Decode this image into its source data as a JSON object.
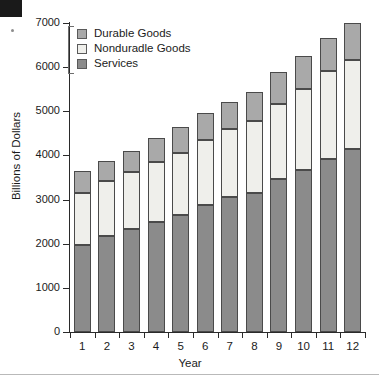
{
  "chart_data": {
    "type": "bar",
    "stacked": true,
    "title": "",
    "xlabel": "Year",
    "ylabel": "Billions of Dollars",
    "categories": [
      "1",
      "2",
      "3",
      "4",
      "5",
      "6",
      "7",
      "8",
      "9",
      "10",
      "11",
      "12"
    ],
    "ylim": [
      0,
      7000
    ],
    "yticks": [
      0,
      1000,
      2000,
      3000,
      4000,
      5000,
      6000,
      7000
    ],
    "ytick_labels": [
      "0",
      "1000",
      "2000",
      "3000",
      "4000",
      "5000",
      "6000",
      "7000"
    ],
    "grid": false,
    "legend_position": "top-left",
    "series": [
      {
        "name": "Services",
        "color": "#8b8b8b",
        "values": [
          1975,
          2180,
          2330,
          2500,
          2650,
          2880,
          3050,
          3150,
          3460,
          3670,
          3930,
          4140
        ]
      },
      {
        "name": "Nonduradle Goods",
        "color": "#efefeb",
        "values": [
          1175,
          1250,
          1300,
          1350,
          1400,
          1470,
          1540,
          1640,
          1700,
          1830,
          1980,
          2020
        ]
      },
      {
        "name": "Durable Goods",
        "color": "#a9a9a9",
        "values": [
          490,
          450,
          470,
          540,
          590,
          620,
          620,
          640,
          720,
          750,
          760,
          840
        ]
      }
    ],
    "totals": [
      3640,
      3880,
      4100,
      4390,
      4640,
      4970,
      5210,
      5430,
      5880,
      6250,
      6670,
      7000
    ]
  },
  "legend": {
    "items": [
      {
        "label": "Durable Goods",
        "color": "#a9a9a9"
      },
      {
        "label": "Nonduradle Goods",
        "color": "#efefeb"
      },
      {
        "label": "Services",
        "color": "#8b8b8b"
      }
    ]
  },
  "axes": {
    "y_title": "Billions of Dollars",
    "x_title": "Year"
  }
}
